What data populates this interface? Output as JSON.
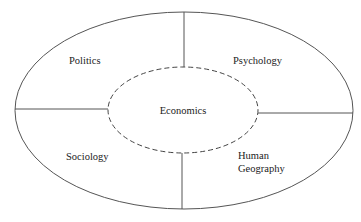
{
  "diagram": {
    "title": "",
    "center": {
      "label": "Economics",
      "style": "dashed-ellipse"
    },
    "segments": [
      {
        "label": "Politics",
        "position": "top-left"
      },
      {
        "label": "Psychology",
        "position": "top-right"
      },
      {
        "label": "Sociology",
        "position": "bottom-left"
      },
      {
        "label_lines": [
          "Human",
          "Geography"
        ],
        "label": "Human Geography",
        "position": "bottom-right"
      }
    ],
    "colors": {
      "line": "#555555",
      "text": "#222222",
      "background": "#ffffff"
    }
  }
}
